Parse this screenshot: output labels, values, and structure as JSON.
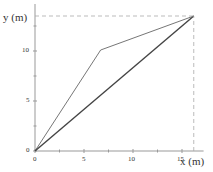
{
  "chart_data": {
    "type": "line",
    "title": "",
    "xlabel": "x (m)",
    "ylabel": "y (m)",
    "xlim": [
      0,
      17
    ],
    "ylim": [
      0,
      14.5
    ],
    "xticks": [
      0,
      5,
      10,
      15
    ],
    "yticks": [
      0,
      5,
      10
    ],
    "grid": false,
    "legend": null,
    "series": [
      {
        "name": "path-1 (two segments)",
        "style": "thin solid",
        "x": [
          0,
          6.7,
          16.2
        ],
        "y": [
          0,
          10.1,
          13.5
        ]
      },
      {
        "name": "displacement (straight)",
        "style": "thick solid",
        "x": [
          0,
          16.2
        ],
        "y": [
          0,
          13.5
        ]
      },
      {
        "name": "horizontal guide",
        "style": "dashed",
        "x": [
          0,
          16.2
        ],
        "y": [
          13.5,
          13.5
        ]
      },
      {
        "name": "vertical guide",
        "style": "dashed",
        "x": [
          16.2,
          16.2
        ],
        "y": [
          0,
          13.5
        ]
      }
    ]
  },
  "axes": {
    "x_title": "x (m)",
    "y_title": "y (m)",
    "x_tick_labels": [
      "0",
      "5",
      "10",
      "15"
    ],
    "y_tick_labels": [
      "0",
      "5",
      "10"
    ]
  }
}
